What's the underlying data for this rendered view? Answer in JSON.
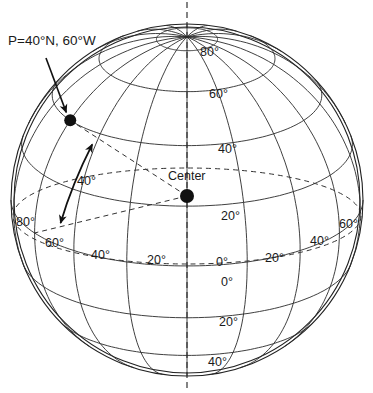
{
  "diagram": {
    "point_label": "P=40°N, 60°W",
    "center_label": "Center",
    "angle_label": "40°",
    "latitude_labels": [
      {
        "text": "80°",
        "lat": 80
      },
      {
        "text": "60°",
        "lat": 60
      },
      {
        "text": "40°",
        "lat": 40
      },
      {
        "text": "20°",
        "lat": 20
      },
      {
        "text": "0°",
        "lat": 0
      },
      {
        "text": "20°",
        "lat": -20
      },
      {
        "text": "40°",
        "lat": -40
      }
    ],
    "longitude_labels": [
      {
        "text": "80°",
        "lon": -80
      },
      {
        "text": "60°",
        "lon": -60
      },
      {
        "text": "40°",
        "lon": -40
      },
      {
        "text": "20°",
        "lon": -20
      },
      {
        "text": "0°",
        "lon": 0
      },
      {
        "text": "20°",
        "lon": 20
      },
      {
        "text": "40°",
        "lon": 40
      },
      {
        "text": "60°",
        "lon": 60
      }
    ],
    "point": {
      "lat": 40,
      "lon": -60
    },
    "parallels": [
      -40,
      -20,
      0,
      20,
      40,
      60,
      80
    ],
    "meridian_step": 20,
    "colors": {
      "ink": "#1a1a1a",
      "background": "#ffffff"
    }
  }
}
